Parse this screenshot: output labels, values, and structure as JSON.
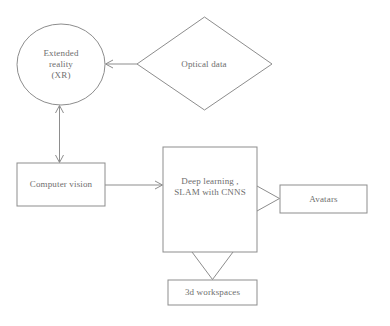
{
  "diagram": {
    "background_color": "#ffffff",
    "stroke_color": "#8d8d8d",
    "text_color": "#6e6e6e",
    "nodes": [
      {
        "id": "extended-reality",
        "label": "Extended\nreality\n(XR)",
        "shape": "ellipse",
        "x": 17,
        "y": 24,
        "width": 88,
        "height": 81
      },
      {
        "id": "optical-data",
        "label": "Optical data",
        "shape": "diamond",
        "x": 137,
        "y": 17,
        "width": 135,
        "height": 93
      },
      {
        "id": "computer-vision",
        "label": "Computer vision",
        "shape": "rectangle",
        "x": 17,
        "y": 163,
        "width": 88,
        "height": 43
      },
      {
        "id": "deep-learning",
        "label": "Deep learning ,\nSLAM with CNNS",
        "shape": "rectangle",
        "x": 163,
        "y": 147,
        "width": 94,
        "height": 105
      },
      {
        "id": "avatars",
        "label": "Avatars",
        "shape": "rectangle",
        "x": 280,
        "y": 185,
        "width": 87,
        "height": 28
      },
      {
        "id": "3d-workspaces",
        "label": "3d workspaces",
        "shape": "rectangle",
        "x": 168,
        "y": 280,
        "width": 89,
        "height": 25
      }
    ],
    "connectors": [
      {
        "id": "optical-data-to-extended-reality",
        "from": "optical-data",
        "to": "extended-reality",
        "direction": "left",
        "arrowhead": "thin-open",
        "double_ended": false
      },
      {
        "id": "extended-reality-to-computer-vision",
        "from": "extended-reality",
        "to": "computer-vision",
        "direction": "vertical",
        "arrowhead": "thin-open",
        "double_ended": true
      },
      {
        "id": "computer-vision-to-deep-learning",
        "from": "computer-vision",
        "to": "deep-learning",
        "direction": "right",
        "arrowhead": "thin-open",
        "double_ended": false
      },
      {
        "id": "deep-learning-to-avatars",
        "from": "deep-learning",
        "to": "avatars",
        "direction": "right",
        "arrowhead": "large-open-triangle",
        "double_ended": false
      },
      {
        "id": "deep-learning-to-3d-workspaces",
        "from": "deep-learning",
        "to": "3d-workspaces",
        "direction": "down",
        "arrowhead": "large-open-triangle",
        "double_ended": false
      }
    ]
  }
}
